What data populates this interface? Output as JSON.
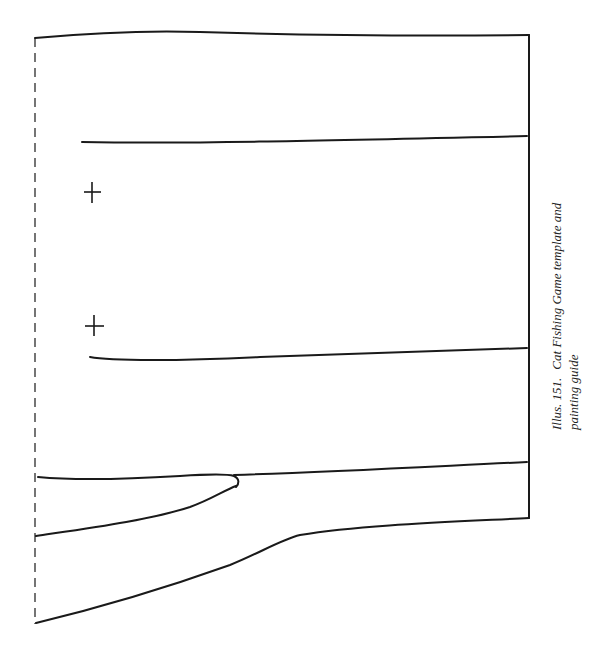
{
  "figure": {
    "caption": {
      "label": "Illus. 151.",
      "line1": "Cat Fishing Game template and",
      "line2": "painting guide"
    },
    "markers": [
      {
        "name": "cross-marker-1",
        "x": 92,
        "y": 192
      },
      {
        "name": "cross-marker-2",
        "x": 94,
        "y": 326
      }
    ],
    "colors": {
      "ink": "#1a1a1a",
      "paper": "#ffffff"
    }
  }
}
